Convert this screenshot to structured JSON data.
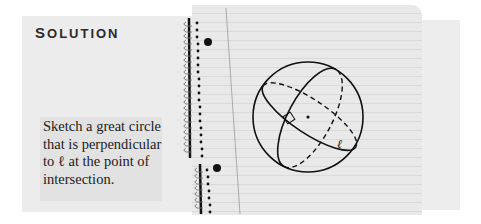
{
  "heading": {
    "first_letter": "S",
    "rest": "OLUTION",
    "full": "SOLUTION"
  },
  "instruction": {
    "lines": [
      "Sketch a great circle",
      "that is perpendicular",
      "to ℓ at the point of",
      "intersection."
    ]
  },
  "figure": {
    "line_label": "ℓ",
    "colors": {
      "stroke": "#111111",
      "paper": "#e9e9e9",
      "panel": "#ececec"
    }
  }
}
